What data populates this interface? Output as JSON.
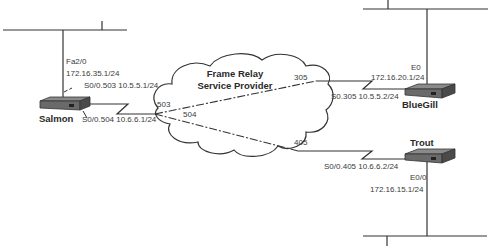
{
  "cloud": {
    "title_line1": "Frame Relay",
    "title_line2": "Service Provider"
  },
  "routers": {
    "salmon": {
      "name": "Salmon",
      "lan_interface": "Fa2/0",
      "lan_ip": "172.16.35.1/24",
      "subif_503": "S0/0.503 10.5.5.1/24",
      "subif_504": "S0/0.504 10.6.6.1/24"
    },
    "bluegill": {
      "name": "BlueGill",
      "lan_interface": "E0",
      "lan_ip": "172.16.20.1/24",
      "subif": "S0.305 10.5.5.2/24"
    },
    "trout": {
      "name": "Trout",
      "lan_interface": "E0/0",
      "lan_ip": "172.16.15.1/24",
      "subif": "S0/0.405 10.6.6.2/24"
    }
  },
  "dlcis": {
    "salmon_to_bluegill": "503",
    "salmon_to_trout": "504",
    "bluegill": "305",
    "trout": "405"
  },
  "colors": {
    "line": "#333333",
    "router_top": "#6e6e6e",
    "router_side": "#3c3c3c"
  }
}
